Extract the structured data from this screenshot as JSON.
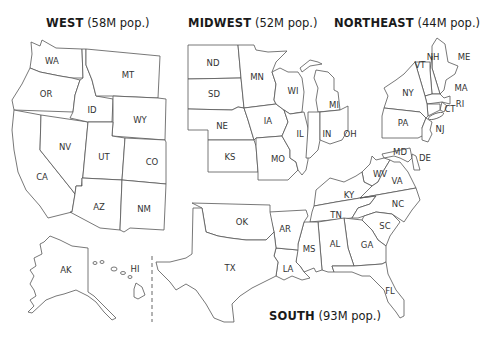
{
  "regions": {
    "west": {
      "name": "WEST",
      "population": "(58M pop.)"
    },
    "midwest": {
      "name": "MIDWEST",
      "population": "(52M pop.)"
    },
    "northeast": {
      "name": "NORTHEAST",
      "population": "(44M pop.)"
    },
    "south": {
      "name": "SOUTH",
      "population": "(93M pop.)"
    }
  },
  "states": {
    "WA": "WA",
    "OR": "OR",
    "CA": "CA",
    "NV": "NV",
    "ID": "ID",
    "MT": "MT",
    "WY": "WY",
    "UT": "UT",
    "CO": "CO",
    "AZ": "AZ",
    "NM": "NM",
    "AK": "AK",
    "HI": "HI",
    "ND": "ND",
    "SD": "SD",
    "NE": "NE",
    "KS": "KS",
    "MN": "MN",
    "IA": "IA",
    "MO": "MO",
    "WI": "WI",
    "IL": "IL",
    "MI": "MI",
    "IN": "IN",
    "OH": "OH",
    "ME": "ME",
    "NH": "NH",
    "VT": "VT",
    "MA": "MA",
    "NY": "NY",
    "RI": "RI",
    "CT": "CT",
    "PA": "PA",
    "NJ": "NJ",
    "MD": "MD",
    "DE": "DE",
    "WV": "WV",
    "VA": "VA",
    "KY": "KY",
    "NC": "NC",
    "TN": "TN",
    "SC": "SC",
    "OK": "OK",
    "AR": "AR",
    "TX": "TX",
    "LA": "LA",
    "MS": "MS",
    "AL": "AL",
    "GA": "GA",
    "FL": "FL"
  },
  "colors": {
    "stroke": "#555555",
    "fill": "#ffffff",
    "text": "#1a1a1a"
  }
}
